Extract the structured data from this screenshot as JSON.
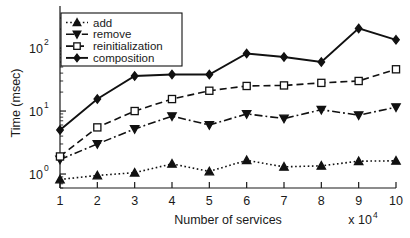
{
  "chart_data": {
    "type": "line",
    "title": "",
    "xlabel": "Number of services",
    "ylabel": "Time (msec)",
    "x_multiplier": "x 10",
    "x_multiplier_exp": "4",
    "xlim": [
      1,
      10
    ],
    "ylim": [
      0.6,
      300
    ],
    "yscale": "log",
    "xscale": "linear",
    "grid": false,
    "legend_position": "upper-left",
    "x": [
      1,
      2,
      3,
      4,
      5,
      6,
      7,
      8,
      9,
      10
    ],
    "xticklabels": [
      "1",
      "2",
      "3",
      "4",
      "5",
      "6",
      "7",
      "8",
      "9",
      "10"
    ],
    "yticklabels": [
      "10",
      "10",
      "10"
    ],
    "yticks": [
      1,
      10,
      100
    ],
    "ytick_exponents": [
      "0",
      "1",
      "2"
    ],
    "series": [
      {
        "name": "add",
        "marker": "triangle-up",
        "line": "dotted",
        "fill": "solid",
        "values": [
          0.82,
          0.95,
          1.05,
          1.45,
          1.1,
          1.65,
          1.3,
          1.35,
          1.6,
          1.62
        ]
      },
      {
        "name": "remove",
        "marker": "triangle-down",
        "line": "dash-dot",
        "fill": "solid",
        "values": [
          1.7,
          3.0,
          5.2,
          8.3,
          6.0,
          9.0,
          7.6,
          10.5,
          8.6,
          11.5
        ]
      },
      {
        "name": "reinitialization",
        "marker": "square",
        "line": "dashed",
        "fill": "open",
        "values": [
          1.9,
          5.5,
          10.0,
          15.5,
          21.0,
          25.0,
          25.5,
          28.0,
          30.0,
          46.0
        ]
      },
      {
        "name": "composition",
        "marker": "diamond",
        "line": "solid",
        "fill": "solid",
        "values": [
          5.0,
          15.5,
          36.0,
          38.0,
          38.0,
          82.0,
          72.0,
          60.0,
          205.0,
          135.0
        ]
      }
    ]
  },
  "legend": {
    "items": [
      {
        "label": "add"
      },
      {
        "label": "remove"
      },
      {
        "label": "reinitialization"
      },
      {
        "label": "composition"
      }
    ]
  }
}
